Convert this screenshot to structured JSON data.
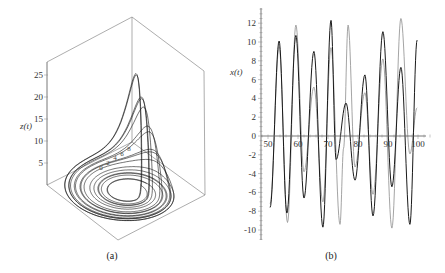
{
  "figure": {
    "panels": [
      {
        "caption": "(a)"
      },
      {
        "caption": "(b)"
      }
    ]
  },
  "chart_data": [
    {
      "type": "line",
      "subtype": "3d-parametric-trajectory",
      "caption": "(a)",
      "title": "",
      "zlabel": "z(t)",
      "z_axis": {
        "ticks": [
          "5",
          "10",
          "15",
          "20",
          "25"
        ],
        "range": [
          0,
          27
        ]
      },
      "floor_axis_ticks": [
        "0",
        "2",
        "4",
        "6",
        "8"
      ],
      "description": "Chaotic spiral attractor: trajectory spirals outward in the base plane and periodically folds up into a tall spike reaching z approx 23-26",
      "trajectory_generator": {
        "system": "Rossler",
        "a": 0.2,
        "b": 0.2,
        "c": 5.7,
        "initial": [
          2.0,
          2.0,
          0.2
        ],
        "t_range": [
          0,
          100
        ]
      },
      "color": "#111111",
      "box": true
    },
    {
      "type": "line",
      "caption": "(b)",
      "title": "",
      "xlabel": "",
      "ylabel": "x(t)",
      "xlim": [
        50,
        100
      ],
      "ylim": [
        -11,
        13
      ],
      "x_ticks": [
        "50",
        "60",
        "70",
        "80",
        "90",
        "100"
      ],
      "y_ticks": [
        "12",
        "10",
        "8",
        "6",
        "4",
        "2",
        "0",
        "-2",
        "-4",
        "-6",
        "-8",
        "-10"
      ],
      "grid": false,
      "legend": null,
      "series": [
        {
          "name": "dark",
          "color": "#1a1a1a",
          "extrema": [
            [
              50.7,
              -7.6
            ],
            [
              53.7,
              10.1
            ],
            [
              56.3,
              -8.2
            ],
            [
              59.3,
              10.7
            ],
            [
              62.0,
              -6.6
            ],
            [
              65.3,
              9.0
            ],
            [
              68.3,
              -9.7
            ],
            [
              71.0,
              12.3
            ],
            [
              72.7,
              -2.5
            ],
            [
              76.0,
              3.5
            ],
            [
              79.0,
              -4.7
            ],
            [
              82.3,
              6.5
            ],
            [
              85.0,
              -8.5
            ],
            [
              88.3,
              11.1
            ],
            [
              91.3,
              -5.4
            ],
            [
              94.3,
              7.3
            ],
            [
              97.3,
              -9.4
            ],
            [
              99.7,
              10.2
            ]
          ]
        },
        {
          "name": "light",
          "color": "#9a9a9a",
          "extrema": [
            [
              50.7,
              -7.2
            ],
            [
              53.7,
              9.5
            ],
            [
              56.5,
              -9.2
            ],
            [
              59.3,
              11.8
            ],
            [
              62.0,
              -3.8
            ],
            [
              65.3,
              5.2
            ],
            [
              68.3,
              -7.0
            ],
            [
              71.0,
              9.4
            ],
            [
              74.0,
              -9.4
            ],
            [
              75.2,
              -1.3
            ],
            [
              76.7,
              11.8
            ],
            [
              79.0,
              -3.3
            ],
            [
              82.3,
              4.6
            ],
            [
              85.0,
              -6.2
            ],
            [
              88.3,
              8.2
            ],
            [
              91.3,
              -9.8
            ],
            [
              94.3,
              12.5
            ],
            [
              97.3,
              -1.9
            ],
            [
              99.7,
              3.0
            ]
          ]
        }
      ]
    }
  ]
}
